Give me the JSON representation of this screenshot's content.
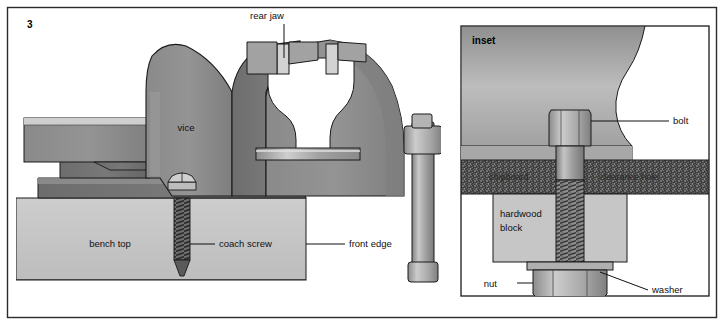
{
  "figure": {
    "number": "3",
    "background": "#ffffff",
    "border_color": "#2b2b2b"
  },
  "palette": {
    "metal_mid": "#8e8e8e",
    "metal_dark": "#6f6f6f",
    "metal_light": "#c9c9c9",
    "metal_highlight": "#e6e6e6",
    "bench_wood": "#c3c3c3",
    "hardwood": "#c6c6c6",
    "chipboard_dark": "#3d3d3d",
    "outline": "#1a1a1a",
    "text": "#101010"
  },
  "main_panel": {
    "name": "main-vice-diagram",
    "labels": {
      "rear_jaw": "rear jaw",
      "vice": "vice",
      "bench_top": "bench top",
      "coach_screw": "coach screw",
      "front_edge": "front edge"
    }
  },
  "inset_panel": {
    "name": "inset-detail-diagram",
    "title": "inset",
    "labels": {
      "bolt": "bolt",
      "chipboard": "chipboard",
      "clearance_hole": "clearance hole",
      "hardwood_block": "hardwood",
      "hardwood_block_line2": "block",
      "nut": "nut",
      "washer": "washer"
    }
  }
}
